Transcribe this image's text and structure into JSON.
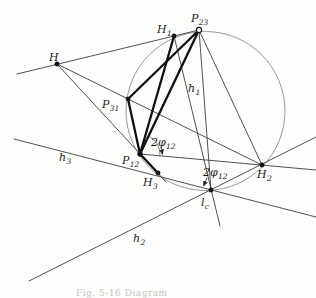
{
  "figure": {
    "caption": "Fig. 5-16   Diagram",
    "ink": "#1c1c1c",
    "thin_line_color": "#3d3d3d",
    "thick_line_color": "#101010",
    "circle_color": "#8f8f8f",
    "background": "#fdfdfc"
  },
  "diagram": {
    "canvas": {
      "width": 316,
      "height": 298
    },
    "circle": {
      "cx": 205.5,
      "cy": 111,
      "r": 79.5
    },
    "points": [
      {
        "id": "H",
        "x": 57,
        "y": 64,
        "marker": "dot",
        "r": 2.2
      },
      {
        "id": "H1",
        "x": 174,
        "y": 36,
        "marker": "dot",
        "r": 2.2
      },
      {
        "id": "P23",
        "x": 199,
        "y": 30,
        "marker": "open",
        "r": 2.6
      },
      {
        "id": "P31",
        "x": 128,
        "y": 99,
        "marker": "dot",
        "r": 2.1
      },
      {
        "id": "P12",
        "x": 140,
        "y": 154,
        "marker": "dot",
        "r": 2.5
      },
      {
        "id": "H3",
        "x": 158,
        "y": 173,
        "marker": "dot",
        "r": 2.2
      },
      {
        "id": "H2",
        "x": 262,
        "y": 165,
        "marker": "dot",
        "r": 2.2
      },
      {
        "id": "lc",
        "x": 211,
        "y": 190,
        "marker": "dot",
        "r": 2.2
      }
    ],
    "thin_lines": [
      {
        "name": "line-through-H-H1-P23",
        "x1": 17,
        "y1": 74,
        "x2": 199,
        "y2": 30
      },
      {
        "name": "line-H-P12-H3",
        "x1": 57,
        "y1": 64,
        "x2": 166,
        "y2": 182
      },
      {
        "name": "line-H-P31-H2",
        "x1": 57,
        "y1": 64,
        "x2": 262,
        "y2": 165
      },
      {
        "name": "line-h3",
        "x1": 14,
        "y1": 139,
        "x2": 316,
        "y2": 217
      },
      {
        "name": "line-h2",
        "x1": 29,
        "y1": 281,
        "x2": 316,
        "y2": 137
      },
      {
        "name": "line-h1",
        "x1": 174,
        "y1": 36,
        "x2": 220,
        "y2": 226
      },
      {
        "name": "line-P23-lc",
        "x1": 199,
        "y1": 30,
        "x2": 211,
        "y2": 190
      },
      {
        "name": "line-P23-H2",
        "x1": 199,
        "y1": 30,
        "x2": 262,
        "y2": 165
      },
      {
        "name": "line-P12-H2-extended",
        "x1": 140,
        "y1": 154,
        "x2": 316,
        "y2": 170
      }
    ],
    "thick_lines": [
      {
        "name": "triangle-side-P23-P31",
        "x1": 199,
        "y1": 30,
        "x2": 128,
        "y2": 99
      },
      {
        "name": "triangle-side-P31-P12",
        "x1": 128,
        "y1": 99,
        "x2": 140,
        "y2": 154
      },
      {
        "name": "triangle-side-P12-P23",
        "x1": 140,
        "y1": 154,
        "x2": 199,
        "y2": 30
      },
      {
        "name": "segment-P12-H1",
        "x1": 140,
        "y1": 154,
        "x2": 174,
        "y2": 36
      },
      {
        "name": "segment-P12-H3",
        "x1": 140,
        "y1": 154,
        "x2": 158,
        "y2": 173
      }
    ],
    "angle_arcs": [
      {
        "name": "angle-arc-2phi12-at-P12",
        "cx": 140,
        "cy": 154,
        "r": 20,
        "start_deg": -65,
        "end_deg": 5
      }
    ],
    "arrows": [
      {
        "name": "leader-arrow-2phi12-first",
        "x1": 161,
        "y1": 147,
        "x2": 162.5,
        "y2": 154.5
      },
      {
        "name": "leader-arrow-2phi12-second",
        "x1": 207,
        "y1": 178,
        "x2": 203.5,
        "y2": 186
      }
    ],
    "labels": [
      {
        "id": "H",
        "main": "H",
        "sub": "",
        "x": 49,
        "y": 61
      },
      {
        "id": "H1",
        "main": "H",
        "sub": "1",
        "x": 157,
        "y": 33
      },
      {
        "id": "P23",
        "main": "P",
        "sub": "23",
        "x": 191,
        "y": 22
      },
      {
        "id": "P31",
        "main": "P",
        "sub": "31",
        "x": 102,
        "y": 108
      },
      {
        "id": "P12",
        "main": "P",
        "sub": "12",
        "x": 122,
        "y": 164
      },
      {
        "id": "H3",
        "main": "H",
        "sub": "3",
        "x": 143,
        "y": 186
      },
      {
        "id": "H2",
        "main": "H",
        "sub": "2",
        "x": 257,
        "y": 178
      },
      {
        "id": "lc",
        "main": "l",
        "sub": "c",
        "x": 201,
        "y": 206
      },
      {
        "id": "h1",
        "main": "h",
        "sub": "1",
        "x": 188,
        "y": 92
      },
      {
        "id": "h2",
        "main": "h",
        "sub": "2",
        "x": 133,
        "y": 242
      },
      {
        "id": "h3",
        "main": "h",
        "sub": "3",
        "x": 59,
        "y": 161
      },
      {
        "id": "phi12-a",
        "main": "2φ",
        "sub": "12",
        "x": 151,
        "y": 146
      },
      {
        "id": "phi12-b",
        "main": "2φ",
        "sub": "12",
        "x": 203,
        "y": 176
      }
    ]
  }
}
